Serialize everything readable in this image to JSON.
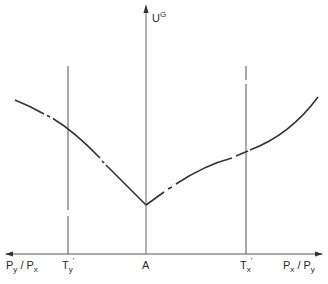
{
  "diagram": {
    "y_axis_label": "U",
    "y_axis_label_sup": "G",
    "x_axis_left_label": {
      "base1": "P",
      "sub1": "y",
      "sep": " / ",
      "base2": "P",
      "sub2": "x"
    },
    "x_axis_right_label": {
      "base1": "P",
      "sub1": "x",
      "sep": " / ",
      "base2": "P",
      "sub2": "y"
    },
    "ticks": [
      {
        "id": "ty",
        "base": "T",
        "sub": "y",
        "prime": "'"
      },
      {
        "id": "a",
        "base": "A"
      },
      {
        "id": "tx",
        "base": "T",
        "sub": "x",
        "prime": "'"
      }
    ],
    "colors": {
      "line": "#333333",
      "axis": "#555555",
      "background": "#ffffff"
    }
  }
}
